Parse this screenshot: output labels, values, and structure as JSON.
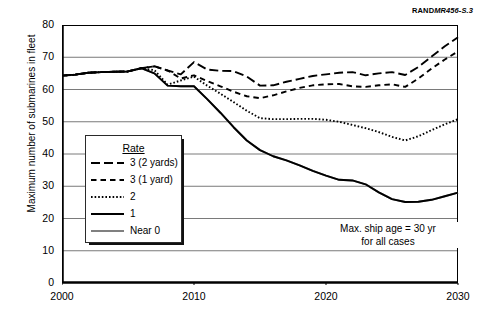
{
  "source_tag": {
    "bold": "RAND",
    "italic": "MR456-S.3"
  },
  "note": {
    "line1": "Max. ship age = 30 yr",
    "line2": "for all cases"
  },
  "legend": {
    "title": "Rate",
    "items": [
      {
        "label": "3 (2 yards)",
        "style": "long-dash",
        "color": "#000000"
      },
      {
        "label": "3 (1 yard)",
        "style": "short-dash",
        "color": "#000000"
      },
      {
        "label": "2",
        "style": "dotted",
        "color": "#000000"
      },
      {
        "label": "1",
        "style": "solid",
        "color": "#000000"
      },
      {
        "label": "Near 0",
        "style": "solid-gray",
        "color": "#808080"
      }
    ]
  },
  "chart_data": {
    "type": "line",
    "title": "",
    "xlabel": "",
    "ylabel": "Maximum number of submarines in fleet",
    "xlim": [
      2000,
      2030
    ],
    "ylim": [
      0,
      80
    ],
    "xticks": [
      2000,
      2010,
      2020,
      2030
    ],
    "yticks": [
      0,
      10,
      20,
      30,
      40,
      50,
      60,
      70,
      80
    ],
    "grid": true,
    "legend_position": "inside-left",
    "x": [
      2000,
      2001,
      2002,
      2003,
      2004,
      2005,
      2006,
      2007,
      2008,
      2009,
      2010,
      2011,
      2012,
      2013,
      2014,
      2015,
      2016,
      2017,
      2018,
      2019,
      2020,
      2021,
      2022,
      2023,
      2024,
      2025,
      2026,
      2027,
      2028,
      2029,
      2030
    ],
    "series": [
      {
        "name": "3 (2 yards)",
        "style": "long-dash",
        "color": "#000000",
        "values": [
          64.3,
          64.6,
          65.2,
          65.4,
          65.5,
          65.6,
          66.6,
          67.2,
          65.9,
          64.7,
          68.5,
          66.2,
          65.8,
          65.7,
          64.0,
          61.2,
          61.3,
          62.4,
          63.3,
          64.2,
          64.7,
          65.2,
          65.4,
          64.4,
          65.0,
          65.4,
          64.5,
          67.0,
          70.2,
          73.4,
          76.2
        ]
      },
      {
        "name": "3 (1 yard)",
        "style": "short-dash",
        "color": "#000000",
        "values": [
          64.3,
          64.6,
          65.2,
          65.4,
          65.5,
          65.6,
          66.6,
          67.2,
          65.9,
          63.4,
          64.4,
          62.6,
          61.0,
          59.3,
          57.9,
          57.3,
          58.2,
          59.4,
          60.5,
          61.3,
          61.6,
          61.7,
          61.0,
          60.8,
          61.3,
          61.6,
          60.8,
          63.4,
          66.5,
          69.3,
          71.8
        ]
      },
      {
        "name": "2",
        "style": "dotted",
        "color": "#000000",
        "values": [
          64.3,
          64.6,
          65.2,
          65.4,
          65.5,
          65.6,
          66.6,
          66.0,
          61.5,
          62.8,
          64.0,
          61.2,
          58.7,
          56.1,
          53.4,
          51.1,
          50.8,
          50.8,
          50.9,
          50.9,
          50.6,
          50.0,
          49.0,
          48.0,
          46.8,
          45.3,
          44.2,
          45.5,
          47.4,
          49.2,
          50.8
        ]
      },
      {
        "name": "1",
        "style": "solid",
        "color": "#000000",
        "values": [
          64.3,
          64.6,
          65.2,
          65.4,
          65.5,
          65.6,
          66.6,
          65.0,
          61.2,
          61.0,
          61.0,
          57.0,
          52.8,
          48.3,
          44.2,
          41.2,
          39.3,
          38.0,
          36.5,
          34.8,
          33.3,
          32.0,
          31.8,
          30.6,
          28.1,
          26.0,
          25.1,
          25.2,
          25.8,
          26.9,
          28.0
        ]
      },
      {
        "name": "Near 0",
        "style": "solid-gray",
        "color": "#808080",
        "values": [
          64.3,
          64.6,
          65.2,
          65.4,
          65.5,
          65.6,
          66.6,
          65.0,
          61.2,
          61.0,
          61.0,
          57.0,
          52.8,
          48.3,
          44.2,
          41.2,
          39.3,
          38.0,
          36.5,
          34.8,
          33.3,
          32.0,
          31.8,
          30.6,
          28.1,
          26.0,
          25.1,
          25.2,
          25.8,
          26.9,
          28.0
        ]
      }
    ]
  }
}
